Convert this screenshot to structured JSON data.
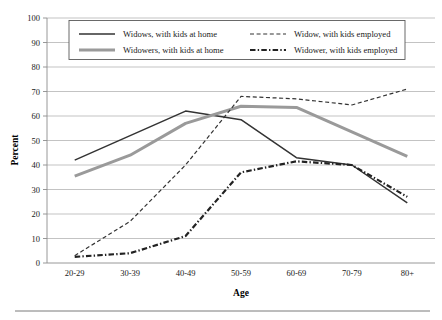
{
  "chart_data": {
    "type": "line",
    "title": "",
    "xlabel": "Age",
    "ylabel": "Percent",
    "categories": [
      "20-29",
      "30-39",
      "40-49",
      "50-59",
      "60-69",
      "70-79",
      "80+"
    ],
    "ylim": [
      0,
      100
    ],
    "ytick_step": 10,
    "yticks": [
      "0",
      "10",
      "20",
      "30",
      "40",
      "50",
      "60",
      "70",
      "80",
      "90",
      "100"
    ],
    "grid": true,
    "legend_position": "top-inside",
    "series": [
      {
        "name": "Widows, with kids at home",
        "style": "solid",
        "color": "#333333",
        "width": 1.5,
        "values": [
          42,
          52,
          62,
          58.5,
          43,
          40,
          24.5
        ]
      },
      {
        "name": "Widowers, with kids at home",
        "style": "solid",
        "color": "#9a9a9a",
        "width": 3.0,
        "values": [
          35.5,
          44,
          57,
          64,
          63.5,
          53.5,
          43.5
        ]
      },
      {
        "name": "Widow, with kids employed",
        "style": "dashed",
        "color": "#333333",
        "width": 1.2,
        "values": [
          3,
          17,
          40,
          68,
          67,
          64.5,
          71
        ]
      },
      {
        "name": "Widower, with kids employed",
        "style": "dashdot",
        "color": "#222222",
        "width": 2.2,
        "values": [
          2.5,
          4,
          11,
          37,
          41.5,
          40,
          27
        ]
      }
    ]
  },
  "axes": {
    "y_title": "Percent",
    "x_title": "Age"
  },
  "legend": {
    "entries": [
      "Widows, with kids at home",
      "Widow, with kids employed",
      "Widowers, with kids at home",
      "Widower, with kids employed"
    ]
  },
  "colors": {
    "dark_line": "#333333",
    "gray_line": "#9a9a9a",
    "grid": "#b4b4b4",
    "axis": "#8c8c8c",
    "text": "#1a1a1a",
    "background": "#ffffff"
  }
}
